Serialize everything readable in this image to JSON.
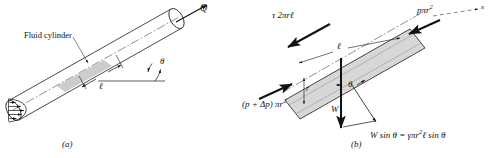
{
  "figure": {
    "type": "technical-diagram",
    "background_color": "#ffffff",
    "line_color": "#1a1a1a",
    "fill_gray": "#d7d7d7",
    "highlight_gray": "#c9c9c9"
  },
  "panel_a": {
    "caption": "(a)",
    "labels": {
      "fluid_cylinder": "Fluid cylinder",
      "flow_rate": "Q",
      "angle": "θ",
      "length": "ℓ"
    },
    "elements": {
      "pipe": "inclined-circular-pipe",
      "velocity_profile": "parabolic-velocity-profile",
      "centerline": "dash-dot-centerline",
      "horizontal_reference": "horizontal-reference-line"
    }
  },
  "panel_b": {
    "caption": "(b)",
    "labels": {
      "shear_force": "τ 2πrℓ",
      "pressure_downstream": "pπr",
      "pressure_downstream_exp": "2",
      "pressure_upstream_pre": "(p + Δp) πr",
      "pressure_upstream_exp": "2",
      "weight": "W",
      "angle": "θ",
      "length": "ℓ",
      "radius": "r",
      "axis": "x",
      "weight_component_lhs": "W sin θ = γπr",
      "weight_component_exp": "2",
      "weight_component_rhs": "ℓ sin θ"
    },
    "elements": {
      "control_volume": "inclined-fluid-cylinder-parallelogram",
      "axis_line": "dashed-x-axis",
      "centerline": "dash-dot-centerline",
      "weight_vector": "downward-weight-arrow",
      "component_vector": "weight-component-along-axis-arrow"
    }
  }
}
